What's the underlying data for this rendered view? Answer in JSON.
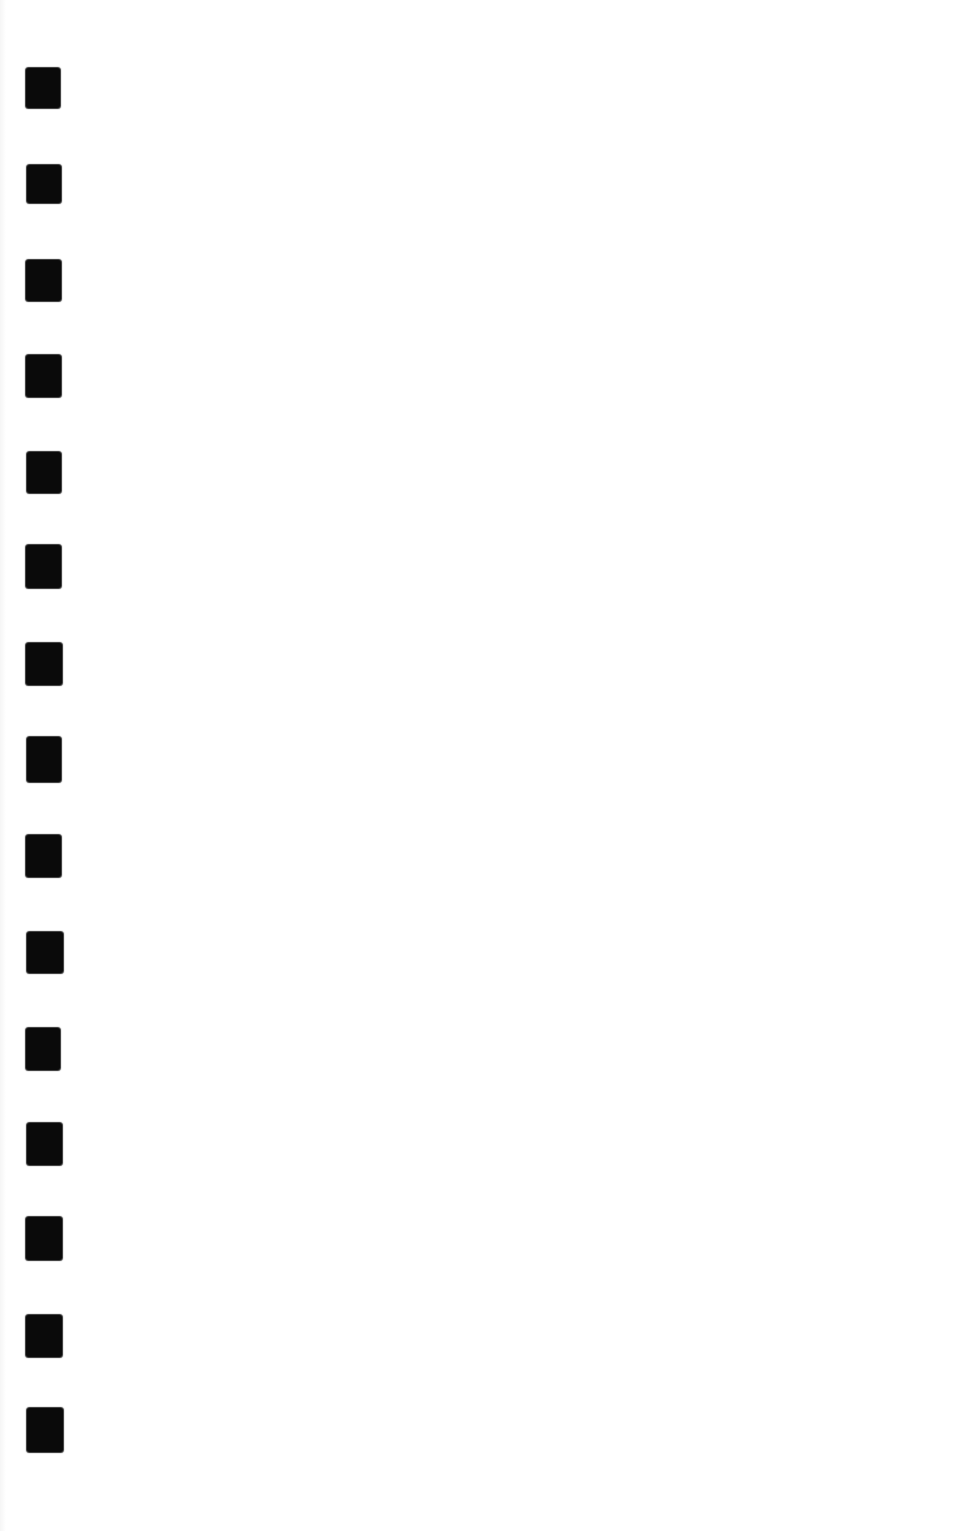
{
  "page": {
    "kind": "scanned-blank-page",
    "background_color": "#ffffff",
    "width": 955,
    "height": 1531,
    "text_content": ""
  },
  "binding_marks": {
    "description": "column of black binding/punch marks on left margin of scan",
    "color": "#0a0a0a",
    "count": 15,
    "marks": [
      {
        "x": 26,
        "y": 68,
        "w": 34,
        "h": 40
      },
      {
        "x": 27,
        "y": 165,
        "w": 34,
        "h": 38
      },
      {
        "x": 26,
        "y": 260,
        "w": 35,
        "h": 41
      },
      {
        "x": 26,
        "y": 355,
        "w": 35,
        "h": 42
      },
      {
        "x": 27,
        "y": 452,
        "w": 34,
        "h": 41
      },
      {
        "x": 26,
        "y": 545,
        "w": 35,
        "h": 43
      },
      {
        "x": 26,
        "y": 643,
        "w": 36,
        "h": 42
      },
      {
        "x": 27,
        "y": 737,
        "w": 34,
        "h": 45
      },
      {
        "x": 26,
        "y": 835,
        "w": 35,
        "h": 42
      },
      {
        "x": 27,
        "y": 932,
        "w": 36,
        "h": 41
      },
      {
        "x": 26,
        "y": 1028,
        "w": 34,
        "h": 42
      },
      {
        "x": 27,
        "y": 1123,
        "w": 35,
        "h": 42
      },
      {
        "x": 26,
        "y": 1217,
        "w": 36,
        "h": 43
      },
      {
        "x": 26,
        "y": 1315,
        "w": 36,
        "h": 42
      },
      {
        "x": 27,
        "y": 1408,
        "w": 36,
        "h": 44
      }
    ]
  }
}
